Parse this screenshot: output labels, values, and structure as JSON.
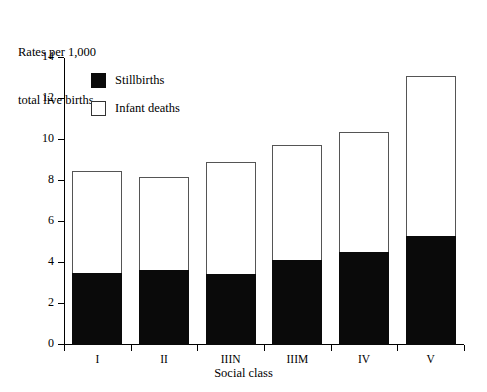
{
  "chart_data": {
    "type": "bar",
    "subtype": "stacked-bar",
    "title": "",
    "ylabel": "Rates per 1,000 total live births",
    "ylabel_lines": [
      "Rates per 1,000",
      "total live births"
    ],
    "xlabel": "Social class",
    "categories": [
      "I",
      "II",
      "IIIN",
      "IIIM",
      "IV",
      "V"
    ],
    "series": [
      {
        "name": "Stillbirths",
        "color": "#0a0a0a",
        "values": [
          3.5,
          3.65,
          3.45,
          4.15,
          4.55,
          5.3
        ]
      },
      {
        "name": "Infant deaths",
        "color": "#ffffff",
        "values": [
          5.0,
          4.55,
          5.5,
          5.6,
          5.85,
          7.8
        ]
      }
    ],
    "totals": [
      8.5,
      8.2,
      8.95,
      9.75,
      10.4,
      13.1
    ],
    "ylim": [
      0,
      14
    ],
    "yticks": [
      0,
      2,
      4,
      6,
      8,
      10,
      12,
      14
    ],
    "ytick_labels": [
      "0",
      "2",
      "4",
      "6",
      "8",
      "10",
      "12",
      "14"
    ],
    "grid": false,
    "legend_position": "inside-top-left",
    "legend_entries": [
      "Stillbirths",
      "Infant deaths"
    ]
  },
  "legend": {
    "items": [
      {
        "label": "Stillbirths",
        "style": "filled"
      },
      {
        "label": "Infant deaths",
        "style": "hollow"
      }
    ]
  }
}
